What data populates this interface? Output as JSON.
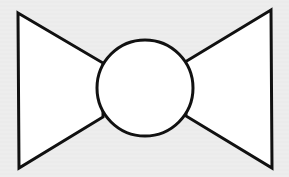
{
  "diagram": {
    "colors": {
      "background": "#ececec",
      "fill": "#ffffff",
      "stroke": "#111111"
    },
    "left_triangle": {
      "points": "18,13 103,63 103,117 19,168"
    },
    "right_triangle": {
      "points": "271,10 185,62 186,116 272,168"
    },
    "center_circle": {
      "cx": 145,
      "cy": 88,
      "r": 48
    }
  }
}
